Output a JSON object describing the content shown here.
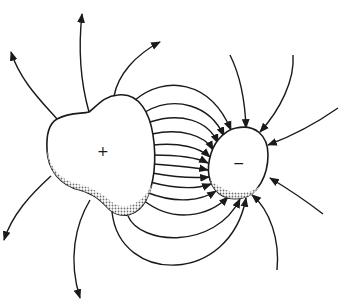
{
  "diagram": {
    "type": "electric-field-lines",
    "positive_conductor": {
      "label": "+",
      "shape": "irregular-blob",
      "position": "left"
    },
    "negative_conductor": {
      "label": "−",
      "shape": "irregular-blob",
      "position": "right"
    },
    "field_lines": {
      "between_conductors": 14,
      "outgoing_from_positive": 5,
      "incoming_to_negative": 6,
      "direction": "positive-to-negative"
    },
    "colors": {
      "stroke": "#1a1a1a",
      "background": "#ffffff",
      "shading": "#777777"
    }
  }
}
